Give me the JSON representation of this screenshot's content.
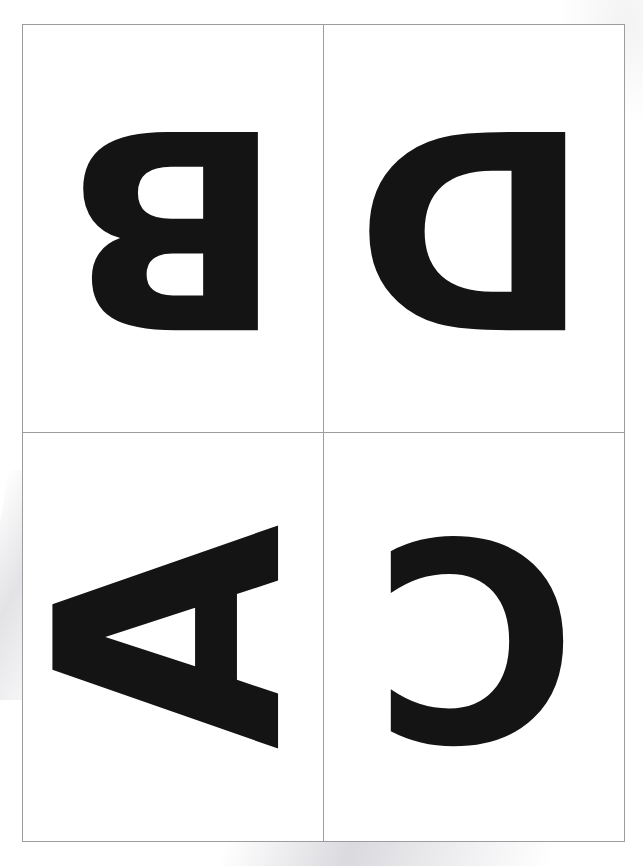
{
  "document": {
    "kind": "scanned-worksheet-page",
    "page_background": "#ffffff",
    "border_color": "#9c9ca0",
    "ink_color": "#141414"
  },
  "grid": {
    "columns": 2,
    "rows": 2,
    "cells": [
      {
        "id": "cell-top-left",
        "position": "top-left",
        "letter": "B",
        "orientation": "rotated-180",
        "orientation_degrees": 180
      },
      {
        "id": "cell-top-right",
        "position": "top-right",
        "letter": "D",
        "orientation": "rotated-180",
        "orientation_degrees": 180
      },
      {
        "id": "cell-bottom-left",
        "position": "bottom-left",
        "letter": "A",
        "orientation": "rotated-90-counterclockwise",
        "orientation_degrees": -90
      },
      {
        "id": "cell-bottom-right",
        "position": "bottom-right",
        "letter": "C",
        "orientation": "rotated-180",
        "orientation_degrees": 180
      }
    ]
  },
  "footer": {
    "credit_text": ""
  }
}
